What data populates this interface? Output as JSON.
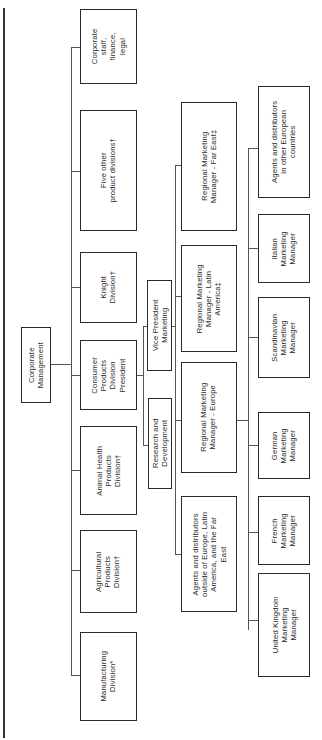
{
  "diagram": {
    "type": "organization-chart",
    "orientation": "rotated-90-ccw",
    "root": {
      "label": "Corporate\nManagement"
    },
    "divisions": [
      {
        "label": "Corporate\nstaff,\nfinance,\nlegal"
      },
      {
        "label": "Five other\nproduct divisions†"
      },
      {
        "label": "Knight\nDivision†"
      },
      {
        "label": "Consumer\nProducts\nDivision\nPresident"
      },
      {
        "label": "Animal Health\nProducts\nDivision†"
      },
      {
        "label": "Agricultural\nProducts\nDivision†"
      },
      {
        "label": "Manufacturing\nDivision*"
      }
    ],
    "consumer_reports": [
      {
        "label": "Vice President\nMarketing"
      },
      {
        "label": "Research and\nDevelopment"
      }
    ],
    "regional": [
      {
        "label": "Regional Marketing\nManager - Far East‡"
      },
      {
        "label": "Regional Marketing\nManager - Latin\nAmerica‡"
      },
      {
        "label": "Regional Marketing\nManager - Europe"
      },
      {
        "label": "Agents and distributors\noutside of Europe, Latin\nAmerica, and the Far\nEast"
      }
    ],
    "europe_reports": [
      {
        "label": "Agents and distributors\nin other European\ncountries"
      },
      {
        "label": "Italian\nMarketing\nManager"
      },
      {
        "label": "Scandinavian\nMarketing\nManager"
      },
      {
        "label": "German\nMarketing\nManager"
      },
      {
        "label": "French\nMarketing\nManager"
      },
      {
        "label": "United Kingdom\nMarketing\nManager"
      }
    ]
  },
  "colors": {
    "line": "#555555",
    "border": "#2a2a2a",
    "background": "#ffffff"
  }
}
